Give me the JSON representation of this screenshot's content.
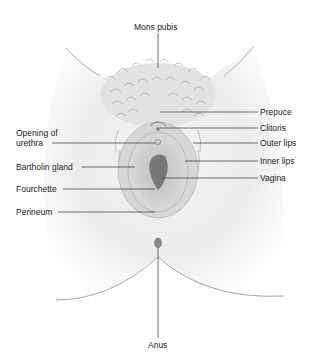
{
  "diagram": {
    "type": "anatomical-illustration",
    "labels": {
      "mons_pubis": "Mons pubis",
      "prepuce": "Prepuce",
      "clitoris": "Clitoris",
      "outer_lips": "Outer lips",
      "inner_lips": "Inner lips",
      "vagina": "Vagina",
      "opening_of_urethra": "Opening of\nurethra",
      "bartholin_gland": "Bartholin gland",
      "fourchette": "Fourchette",
      "perineum": "Perineum",
      "anus": "Anus"
    },
    "colors": {
      "skin_shade": "#e4e4e4",
      "hair": "#8a8a8a",
      "vestibule": "#b9b9b9",
      "vaginal_opening": "#777777",
      "leader_line": "#333333"
    }
  }
}
